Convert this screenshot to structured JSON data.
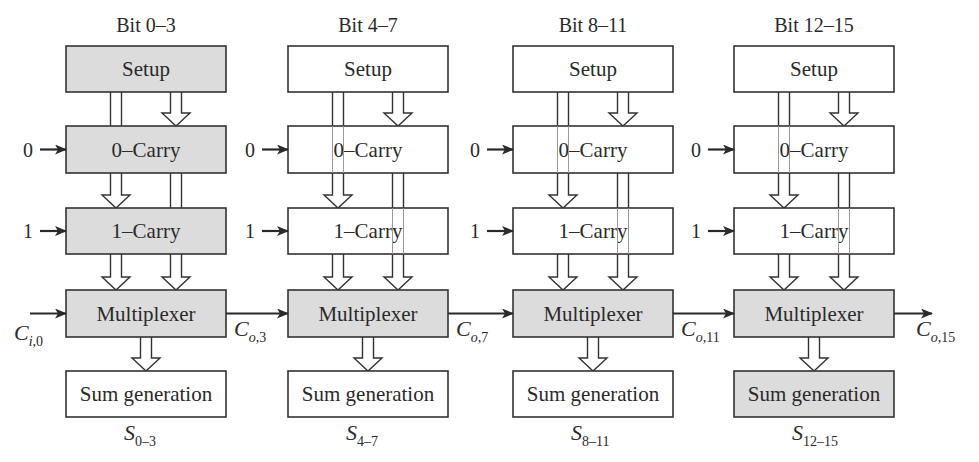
{
  "diagram": {
    "type": "carry-select adder block diagram (16-bit, 4-bit stages)",
    "colors": {
      "highlight_fill": "#dcdcdc",
      "plain_fill": "#ffffff",
      "stroke": "#333333"
    },
    "stages": [
      {
        "title": "Bit 0–3",
        "blocks": {
          "setup": {
            "label": "Setup",
            "highlighted": true
          },
          "carry0": {
            "label": "0–Carry",
            "highlighted": true
          },
          "carry1": {
            "label": "1–Carry",
            "highlighted": true
          },
          "mux": {
            "label": "Multiplexer",
            "highlighted": true
          },
          "sum": {
            "label": "Sum generation",
            "highlighted": false
          }
        },
        "carry0_input": "0",
        "carry1_input": "1",
        "carry_in": {
          "main": "C",
          "sub": "i,0"
        },
        "carry_out": {
          "main": "C",
          "sub": "o,3"
        },
        "sum_out": {
          "main": "S",
          "sub": "0–3"
        }
      },
      {
        "title": "Bit 4–7",
        "blocks": {
          "setup": {
            "label": "Setup",
            "highlighted": false
          },
          "carry0": {
            "label": "0–Carry",
            "highlighted": false
          },
          "carry1": {
            "label": "1–Carry",
            "highlighted": false
          },
          "mux": {
            "label": "Multiplexer",
            "highlighted": true
          },
          "sum": {
            "label": "Sum generation",
            "highlighted": false
          }
        },
        "carry0_input": "0",
        "carry1_input": "1",
        "carry_out": {
          "main": "C",
          "sub": "o,7"
        },
        "sum_out": {
          "main": "S",
          "sub": "4–7"
        }
      },
      {
        "title": "Bit 8–11",
        "blocks": {
          "setup": {
            "label": "Setup",
            "highlighted": false
          },
          "carry0": {
            "label": "0–Carry",
            "highlighted": false
          },
          "carry1": {
            "label": "1–Carry",
            "highlighted": false
          },
          "mux": {
            "label": "Multiplexer",
            "highlighted": true
          },
          "sum": {
            "label": "Sum generation",
            "highlighted": false
          }
        },
        "carry0_input": "0",
        "carry1_input": "1",
        "carry_out": {
          "main": "C",
          "sub": "o,11"
        },
        "sum_out": {
          "main": "S",
          "sub": "8–11"
        }
      },
      {
        "title": "Bit 12–15",
        "blocks": {
          "setup": {
            "label": "Setup",
            "highlighted": false
          },
          "carry0": {
            "label": "0–Carry",
            "highlighted": false
          },
          "carry1": {
            "label": "1–Carry",
            "highlighted": false
          },
          "mux": {
            "label": "Multiplexer",
            "highlighted": true
          },
          "sum": {
            "label": "Sum generation",
            "highlighted": true
          }
        },
        "carry0_input": "0",
        "carry1_input": "1",
        "carry_out": {
          "main": "C",
          "sub": "o,15"
        },
        "sum_out": {
          "main": "S",
          "sub": "12–15"
        }
      }
    ]
  }
}
